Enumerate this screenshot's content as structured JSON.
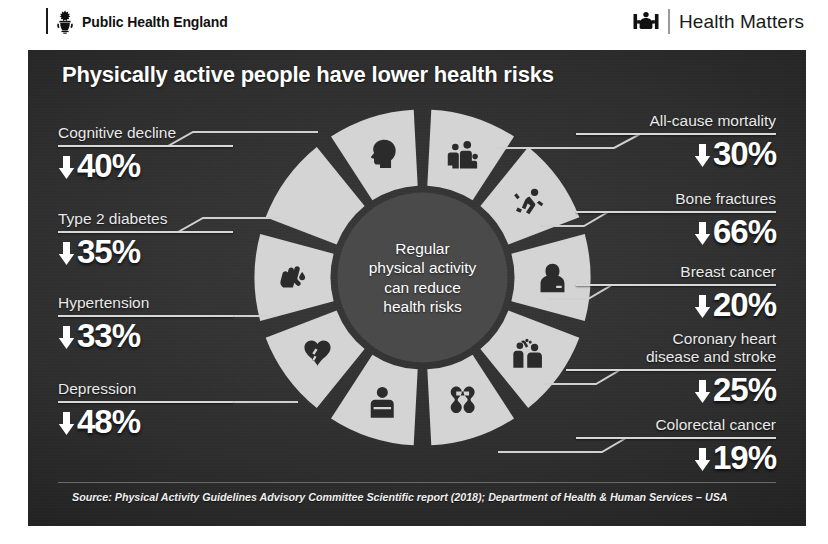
{
  "masthead": {
    "phe_label": "Public Health England",
    "phe_crest_icon": "royal-crest-icon",
    "hm_label": "Health Matters",
    "hm_mark_icon": "health-matters-people-icon"
  },
  "panel": {
    "title": "Physically active people have lower health risks",
    "bg_color": "#2e2e2e",
    "segment_color": "#d4d4d4",
    "hub_color": "#4a4a4a",
    "text_color": "#ffffff"
  },
  "center": {
    "lines": [
      "Regular",
      "physical activity",
      "can reduce",
      "health risks"
    ]
  },
  "stats_left": [
    {
      "label": "Cognitive decline",
      "value": "40%",
      "arrow": "down-arrow-icon",
      "icon": "brain-head-icon"
    },
    {
      "label": "Type 2 diabetes",
      "value": "35%",
      "arrow": "down-arrow-icon",
      "icon": "finger-blood-test-icon"
    },
    {
      "label": "Hypertension",
      "value": "33%",
      "arrow": "down-arrow-icon",
      "icon": "heart-icon"
    },
    {
      "label": "Depression",
      "value": "48%",
      "arrow": "down-arrow-icon",
      "icon": "person-head-down-icon"
    }
  ],
  "stats_right": [
    {
      "label": "All-cause mortality",
      "value": "30%",
      "arrow": "down-arrow-icon",
      "icon": "family-group-icon"
    },
    {
      "label": "Bone fractures",
      "value": "66%",
      "arrow": "down-arrow-icon",
      "icon": "falling-person-icon"
    },
    {
      "label": "Breast cancer",
      "value": "20%",
      "arrow": "down-arrow-icon",
      "icon": "woman-icon"
    },
    {
      "label": "Coronary heart disease and stroke",
      "label_line1": "Coronary heart",
      "label_line2": "disease and stroke",
      "value": "25%",
      "arrow": "down-arrow-icon",
      "icon": "stroke-care-icon"
    },
    {
      "label": "Colorectal cancer",
      "value": "19%",
      "arrow": "down-arrow-icon",
      "icon": "colon-icon"
    }
  ],
  "chart_data": {
    "type": "pie",
    "title": "Physically active people have lower health risks",
    "subtitle": "Regular physical activity can reduce health risks",
    "categories": [
      "Cognitive decline",
      "Type 2 diabetes",
      "Hypertension",
      "Depression",
      "Colorectal cancer",
      "Coronary heart disease and stroke",
      "Breast cancer",
      "Bone fractures",
      "All-cause mortality"
    ],
    "values": [
      40,
      35,
      33,
      48,
      19,
      25,
      20,
      66,
      30
    ],
    "value_unit": "%",
    "value_direction": "decrease",
    "ylabel": "Reduction in risk (%)",
    "xlabel": "",
    "legend": "none",
    "grid": false,
    "note": "Donut of 10 equal icon segments; percentages are risk reductions, not slice sizes",
    "segments": 10,
    "annotations": [
      "Source: Physical Activity Guidelines Advisory Committee Scientific report (2018); Department of Health & Human Services - USA"
    ]
  },
  "source": "Source: Physical Activity Guidelines Advisory Committee Scientific report (2018); Department of Health & Human Services – USA"
}
